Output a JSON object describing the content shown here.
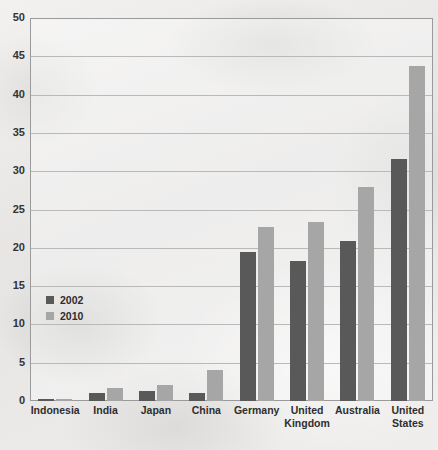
{
  "chart_data": {
    "type": "bar",
    "title": "",
    "xlabel": "",
    "ylabel": "",
    "ylim": [
      0,
      50
    ],
    "yticks": [
      0,
      5,
      10,
      15,
      20,
      25,
      30,
      35,
      40,
      45,
      50
    ],
    "grid": true,
    "legend_position": "inside-left",
    "categories": [
      "Indonesia",
      "India",
      "Japan",
      "China",
      "Germany",
      "United Kingdom",
      "Australia",
      "United States"
    ],
    "series": [
      {
        "name": "2002",
        "color": "#595959",
        "values": [
          0.2,
          1.0,
          1.3,
          1.0,
          19.5,
          18.3,
          20.9,
          31.6
        ]
      },
      {
        "name": "2010",
        "color": "#a6a6a6",
        "values": [
          0.3,
          1.7,
          2.1,
          4.0,
          22.7,
          23.4,
          28.0,
          43.8
        ]
      }
    ]
  },
  "axis": {
    "y_labels": [
      "50",
      "45",
      "40",
      "35",
      "30",
      "25",
      "20",
      "15",
      "10",
      "5",
      "0"
    ]
  },
  "legend": {
    "items": [
      {
        "label": "2002",
        "color": "#595959"
      },
      {
        "label": "2010",
        "color": "#a6a6a6"
      }
    ]
  },
  "colors": {
    "series_2002": "#595959",
    "series_2010": "#a6a6a6",
    "gridline": "#b9b9b9",
    "frame": "#9a9a9a",
    "background": "#eceaea"
  }
}
